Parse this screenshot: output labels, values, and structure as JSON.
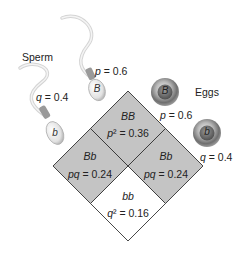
{
  "labels": {
    "sperm": "Sperm",
    "eggs": "Eggs"
  },
  "sperm": [
    {
      "allele": "B",
      "freq_label": "p = 0.6"
    },
    {
      "allele": "b",
      "freq_label": "q = 0.4"
    }
  ],
  "eggs": [
    {
      "allele": "B",
      "freq_label": "p = 0.6"
    },
    {
      "allele": "b",
      "freq_label": "q = 0.4"
    }
  ],
  "cells": {
    "top": {
      "genotype": "BB",
      "freq": "p² = 0.36"
    },
    "left": {
      "genotype": "Bb",
      "freq": "pq = 0.24"
    },
    "right": {
      "genotype": "Bb",
      "freq": "pq = 0.24"
    },
    "bottom": {
      "genotype": "bb",
      "freq": "q² = 0.16"
    }
  },
  "colors": {
    "shaded": "#c4c4c4",
    "unshaded": "#ffffff",
    "outline": "#333333"
  }
}
